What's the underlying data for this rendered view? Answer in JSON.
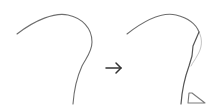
{
  "diagram": {
    "colors": {
      "curve": "#6e6e6e",
      "original_overlay": "#b4b4b4",
      "arrow": "#333333",
      "triangle": "#7a7a7a"
    },
    "left_curve": {
      "label": "original-curve"
    },
    "arrow": {
      "label": "transforms-to",
      "glyph": "→"
    },
    "right_curve": {
      "label": "modified-curve"
    },
    "marker": {
      "label": "triangle-marker"
    }
  }
}
